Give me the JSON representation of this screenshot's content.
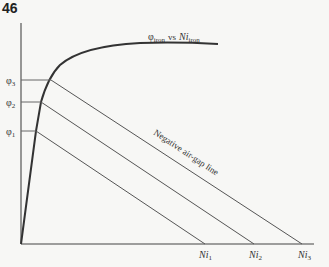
{
  "page_number": "46",
  "curve_label": {
    "phi": "φ",
    "phi_sub": "iron",
    "vs": "vs",
    "ni": "Ni",
    "ni_sub": "iron"
  },
  "y_labels": [
    {
      "base": "φ",
      "sub": "3"
    },
    {
      "base": "φ",
      "sub": "2"
    },
    {
      "base": "φ",
      "sub": "1"
    }
  ],
  "x_labels": [
    {
      "base": "Ni",
      "sub": "1"
    },
    {
      "base": "Ni",
      "sub": "2"
    },
    {
      "base": "Ni",
      "sub": "3"
    }
  ],
  "line_label": "Negative air-gap line",
  "colors": {
    "lines": "#444444",
    "curve": "#333333",
    "background": "#f7f7f5"
  }
}
